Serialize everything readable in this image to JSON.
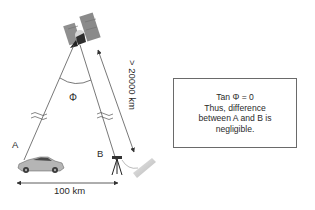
{
  "diagram": {
    "labels": {
      "angle": "Φ",
      "point_a": "A",
      "point_b": "B",
      "distance_vertical": "> 20000 km",
      "distance_horizontal": "100 km"
    },
    "note_box": {
      "lines": [
        "Tan Φ = 0",
        "Thus, difference",
        "between A and B is",
        "negligible."
      ]
    },
    "icons": {
      "satellite": "satellite-icon",
      "car": "car-icon",
      "tripod": "survey-tripod-icon",
      "antenna": "ground-antenna-icon"
    },
    "colors": {
      "line": "#555555",
      "text": "#2a2a2a",
      "panel": "#8a8a8a",
      "box_border": "#6a6a6a"
    }
  }
}
